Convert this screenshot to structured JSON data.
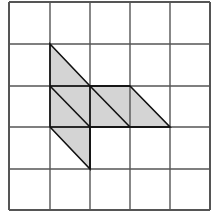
{
  "diagram": {
    "type": "grid-figure",
    "grid": {
      "rows": 5,
      "cols": 5,
      "x_lines": [
        9,
        50,
        90,
        130,
        170,
        210
      ],
      "y_lines": [
        2,
        44,
        86,
        127,
        169,
        210
      ],
      "line_color": "#555555"
    },
    "shaded_figure": {
      "fill": "#d4d4d4",
      "stroke": "#111111",
      "outline_points": "50,44 90,86 130,86 170,127 90,127 90,169 50,127",
      "inner_segments": [
        {
          "x1": 50,
          "y1": 86,
          "x2": 90,
          "y2": 127
        },
        {
          "x1": 90,
          "y1": 86,
          "x2": 130,
          "y2": 127
        },
        {
          "x1": 50,
          "y1": 86,
          "x2": 130,
          "y2": 86
        },
        {
          "x1": 50,
          "y1": 127,
          "x2": 170,
          "y2": 127
        },
        {
          "x1": 90,
          "y1": 86,
          "x2": 90,
          "y2": 169
        }
      ]
    }
  }
}
